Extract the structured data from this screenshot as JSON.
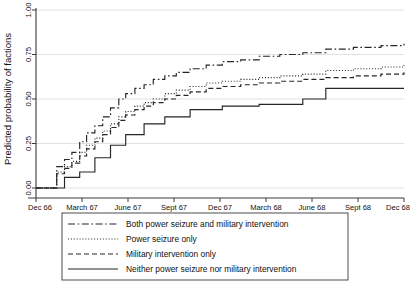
{
  "chart_data": {
    "type": "line",
    "title": "",
    "xlabel": "",
    "ylabel": "Predicted probability of factions",
    "ylim": [
      0,
      1
    ],
    "yticks": [
      0.0,
      0.25,
      0.5,
      0.75,
      1.0
    ],
    "ytick_labels": [
      "0.00",
      "0.25",
      "0.50",
      "0.75",
      "1.00"
    ],
    "xtick_labels": [
      "Dec 66",
      "March 67",
      "June 67",
      "Sept 67",
      "Dec 67",
      "March 68",
      "June 68",
      "Sept 68",
      "Dec 68"
    ],
    "x": [
      0,
      1,
      2,
      3,
      4,
      5,
      6,
      7,
      8
    ],
    "grid": "horizontal",
    "legend_position": "below-axes",
    "step_style": "post",
    "series": [
      {
        "name": "Both power seizure and military intervention",
        "dash": "dashdot",
        "x": [
          0.0,
          0.3,
          0.45,
          0.62,
          0.78,
          0.95,
          1.1,
          1.28,
          1.45,
          1.62,
          1.8,
          1.95,
          2.15,
          2.35,
          2.55,
          2.8,
          3.05,
          3.35,
          3.7,
          4.05,
          4.45,
          4.85,
          5.3,
          5.8,
          6.3,
          6.9,
          7.5,
          8.0
        ],
        "values": [
          0.0,
          0.0,
          0.12,
          0.16,
          0.2,
          0.26,
          0.31,
          0.35,
          0.4,
          0.45,
          0.5,
          0.53,
          0.56,
          0.58,
          0.61,
          0.63,
          0.65,
          0.67,
          0.69,
          0.71,
          0.72,
          0.74,
          0.75,
          0.76,
          0.78,
          0.79,
          0.8,
          0.81
        ]
      },
      {
        "name": "Power seizure only",
        "dash": "dotted",
        "x": [
          0.0,
          0.3,
          0.45,
          0.62,
          0.78,
          0.95,
          1.1,
          1.28,
          1.45,
          1.62,
          1.8,
          1.95,
          2.15,
          2.35,
          2.55,
          2.8,
          3.05,
          3.35,
          3.7,
          4.05,
          4.45,
          4.85,
          5.3,
          5.8,
          6.3,
          6.9,
          7.5,
          8.0
        ],
        "values": [
          0.0,
          0.0,
          0.09,
          0.12,
          0.15,
          0.2,
          0.24,
          0.28,
          0.32,
          0.36,
          0.4,
          0.43,
          0.46,
          0.48,
          0.5,
          0.53,
          0.55,
          0.57,
          0.59,
          0.6,
          0.61,
          0.62,
          0.63,
          0.64,
          0.66,
          0.67,
          0.68,
          0.69
        ]
      },
      {
        "name": "Military intervention only",
        "dash": "dashed",
        "x": [
          0.0,
          0.3,
          0.45,
          0.62,
          0.78,
          0.95,
          1.1,
          1.28,
          1.45,
          1.62,
          1.8,
          1.95,
          2.15,
          2.35,
          2.55,
          2.8,
          3.05,
          3.35,
          3.7,
          4.05,
          4.45,
          4.85,
          5.3,
          5.8,
          6.3,
          6.9,
          7.5,
          8.0
        ],
        "values": [
          0.0,
          0.0,
          0.08,
          0.11,
          0.14,
          0.18,
          0.22,
          0.26,
          0.3,
          0.34,
          0.38,
          0.41,
          0.44,
          0.46,
          0.48,
          0.5,
          0.52,
          0.54,
          0.56,
          0.57,
          0.58,
          0.59,
          0.6,
          0.61,
          0.62,
          0.63,
          0.64,
          0.65
        ]
      },
      {
        "name": "Neither power seizure nor military intervention",
        "dash": "solid",
        "x": [
          0.0,
          0.35,
          0.62,
          0.95,
          1.28,
          1.62,
          1.95,
          2.35,
          2.8,
          3.35,
          4.05,
          4.85,
          5.8,
          6.3,
          8.0
        ],
        "values": [
          0.0,
          0.0,
          0.06,
          0.09,
          0.17,
          0.24,
          0.3,
          0.36,
          0.4,
          0.44,
          0.46,
          0.47,
          0.5,
          0.56,
          0.56
        ]
      }
    ]
  },
  "legend": {
    "entries": [
      {
        "label": "Both power seizure and military intervention",
        "dash": "dashdot"
      },
      {
        "label": "Power seizure only",
        "dash": "dotted"
      },
      {
        "label": "Military intervention only",
        "dash": "dashed"
      },
      {
        "label": "Neither power seizure nor military intervention",
        "dash": "solid"
      }
    ]
  },
  "colors": {
    "line": "#262626",
    "grid": "#d9d9d9",
    "axis": "#3a3a3a",
    "background": "#ffffff"
  }
}
